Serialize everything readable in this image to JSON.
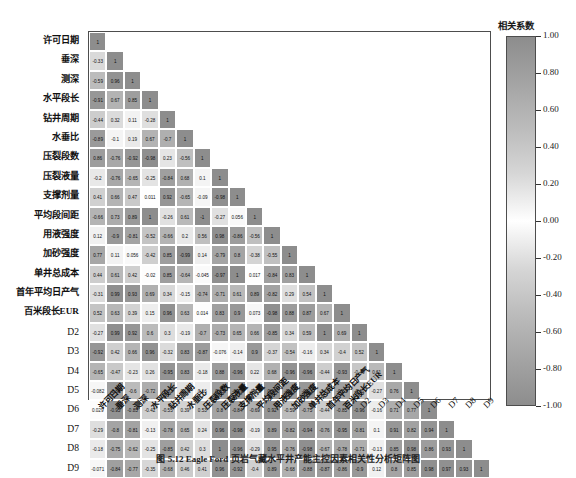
{
  "figure": {
    "caption": "图 5.12  Eagle Ford 页岩气藏水平井产能主控因素相关性分析矩阵图",
    "colorbar_title": "相关系数",
    "colorbar_ticks": [
      "1.00",
      "0.80",
      "0.60",
      "0.40",
      "0.20",
      "0.00",
      "-0.20",
      "-0.40",
      "-0.60",
      "-0.80",
      "-1.00"
    ],
    "colors": {
      "positive_high": "#8d8d8d",
      "zero": "#ffffff",
      "negative_high": "#8d8d8d",
      "frame": "#4d4d4d"
    }
  },
  "chart_data": {
    "type": "heatmap",
    "title": "",
    "xlabel": "",
    "ylabel": "",
    "grid": false,
    "legend_position": "right",
    "colormap": "grayscale-diverging",
    "zlim": [
      -1.0,
      1.0
    ],
    "zlabel": "相关系数",
    "triangle": "lower",
    "categories": [
      "许可日期",
      "垂深",
      "测深",
      "水平段长",
      "钻井周期",
      "水垂比",
      "压裂段数",
      "压裂液量",
      "支撑剂量",
      "平均段间距",
      "用液强度",
      "加砂强度",
      "单井总成本",
      "首年平均日产气",
      "百米段长EUR",
      "D2",
      "D3",
      "D4",
      "D5",
      "D6",
      "D7",
      "D8",
      "D9"
    ],
    "matrix": [
      [
        "1"
      ],
      [
        "-0.33",
        "1"
      ],
      [
        "-0.59",
        "0.96",
        "1"
      ],
      [
        "-0.91",
        "0.67",
        "0.85",
        "1"
      ],
      [
        "-0.44",
        "0.32",
        "0.11",
        "-0.28",
        "1"
      ],
      [
        "-0.89",
        "-0.1",
        "0.19",
        "0.67",
        "-0.7",
        "1"
      ],
      [
        "0.86",
        "-0.76",
        "-0.92",
        "-0.98",
        "0.23",
        "-0.56",
        "1"
      ],
      [
        "-0.2",
        "-0.76",
        "-0.65",
        "-0.25",
        "-0.84",
        "0.68",
        "0.1",
        "1"
      ],
      [
        "0.41",
        "0.66",
        "0.47",
        "0.011",
        "0.92",
        "-0.65",
        "-0.09",
        "-0.98",
        "1"
      ],
      [
        "-0.66",
        "0.73",
        "0.89",
        "1",
        "-0.26",
        "0.61",
        "-1",
        "-0.27",
        "0.056",
        "1"
      ],
      [
        "0.12",
        "-0.9",
        "-0.81",
        "-0.52",
        "-0.66",
        "0.2",
        "0.56",
        "0.98",
        "-0.86",
        "-0.56",
        "1"
      ],
      [
        "0.77",
        "0.11",
        "0.056",
        "-0.42",
        "0.85",
        "-0.99",
        "0.14",
        "-0.79",
        "0.8",
        "-0.38",
        "-0.55",
        "1"
      ],
      [
        "0.44",
        "0.61",
        "0.42",
        "-0.02",
        "0.85",
        "-0.64",
        "-0.045",
        "-0.97",
        "1",
        "0.017",
        "-0.84",
        "0.83",
        "1"
      ],
      [
        "-0.31",
        "0.99",
        "0.93",
        "0.69",
        "0.34",
        "-0.15",
        "-0.74",
        "-0.71",
        "0.61",
        "0.89",
        "-0.82",
        "0.29",
        "0.54",
        "1"
      ],
      [
        "0.52",
        "0.63",
        "0.39",
        "0.15",
        "0.96",
        "0.63",
        "0.014",
        "0.83",
        "0.9",
        "0.073",
        "-0.98",
        "0.88",
        "0.87",
        "0.67",
        "1"
      ],
      [
        "-0.27",
        "0.99",
        "0.92",
        "0.6",
        "0.3",
        "-0.19",
        "-0.7",
        "-0.73",
        "0.65",
        "0.66",
        "-0.85",
        "0.34",
        "0.59",
        "1",
        "0.69",
        "1"
      ],
      [
        "-0.92",
        "0.42",
        "0.66",
        "0.96",
        "-0.32",
        "0.83",
        "-0.87",
        "-0.076",
        "-0.14",
        "0.9",
        "-0.37",
        "-0.54",
        "-0.16",
        "0.34",
        "-0.4",
        "0.52",
        "1"
      ],
      [
        "-0.65",
        "-0.47",
        "-0.23",
        "0.26",
        "-0.95",
        "0.83",
        "-0.18",
        "0.88",
        "-0.96",
        "0.22",
        "0.68",
        "-0.96",
        "-0.96",
        "-0.44",
        "-0.93",
        "-0.49",
        "0.61",
        "1"
      ],
      [
        "-0.082",
        "-0.88",
        "-0.6",
        "-0.72",
        "-0.82",
        "0.26",
        "0.16",
        "0.85",
        "-0.89",
        "-0.33",
        "0.94",
        "-0.87",
        "-0.91",
        "-0.58",
        "-0.83",
        "-0.62",
        "-0.27",
        "0.76",
        "1"
      ],
      [
        "0.029",
        "-0.95",
        "-0.85",
        "-0.42",
        "-0.55",
        "0.39",
        "0.53",
        "0.8",
        "-0.84",
        "-0.69",
        "0.92",
        "-0.59",
        "-0.75",
        "-0.44",
        "-0.85",
        "-0.96",
        "-0.16",
        "0.71",
        "0.77",
        "1"
      ],
      [
        "-0.29",
        "-0.8",
        "-0.81",
        "-0.13",
        "-0.78",
        "0.65",
        "0.24",
        "0.96",
        "-0.98",
        "-0.19",
        "0.89",
        "-0.82",
        "-0.94",
        "-0.76",
        "-0.95",
        "-0.81",
        "0.1",
        "0.91",
        "0.82",
        "0.94",
        "1"
      ],
      [
        "-0.18",
        "-0.75",
        "-0.62",
        "-0.25",
        "-0.85",
        "0.42",
        "0.3",
        "1",
        "-0.96",
        "-0.29",
        "0.95",
        "-0.76",
        "-0.98",
        "-0.67",
        "-0.78",
        "-0.71",
        "-0.13",
        "0.85",
        "0.98",
        "0.86",
        "0.93",
        "1"
      ],
      [
        "-0.071",
        "-0.84",
        "-0.77",
        "-0.35",
        "-0.68",
        "0.46",
        "0.41",
        "0.96",
        "-0.92",
        "-0.4",
        "0.89",
        "-0.68",
        "-0.88",
        "-0.87",
        "-0.86",
        "-0.9",
        "0.12",
        "0.8",
        "0.85",
        "0.98",
        "0.97",
        "0.93",
        "1"
      ]
    ]
  }
}
